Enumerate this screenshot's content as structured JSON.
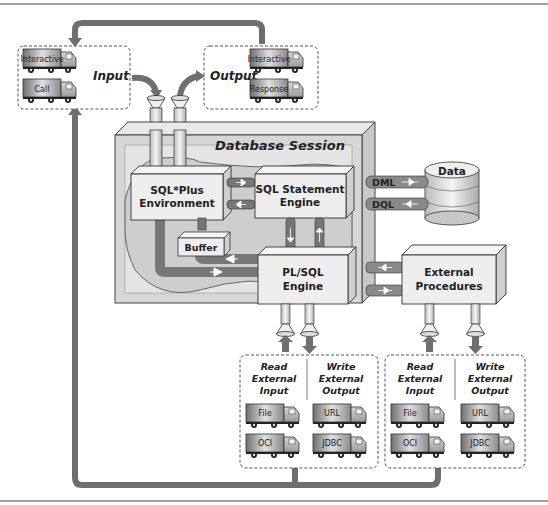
{
  "title": "Database Session",
  "colors": {
    "pipe": "#7a7a7a",
    "pipe_dark": "#555555",
    "box_fill": "#eeeeee",
    "session_fill": "#d6d6d6",
    "session_inner": "#e6e6e6",
    "line": "#333333",
    "truck_body": "#9a9a9a"
  },
  "input_box": {
    "label": "Input",
    "trucks": [
      "Interactive",
      "Call"
    ]
  },
  "output_box": {
    "label": "Output",
    "trucks": [
      "Interactive",
      "Response"
    ]
  },
  "engines": {
    "sqlplus": [
      "SQL*Plus",
      "Environment"
    ],
    "sql_statement": [
      "SQL Statement",
      "Engine"
    ],
    "buffer": "Buffer",
    "plsql": [
      "PL/SQL",
      "Engine"
    ],
    "external_procedures": [
      "External",
      "Procedures"
    ]
  },
  "data_store": {
    "label": "Data",
    "channels": [
      "DML",
      "DQL"
    ]
  },
  "external_io": [
    {
      "read": {
        "label": [
          "Read",
          "External",
          "Input"
        ],
        "trucks": [
          "File",
          "OCI"
        ]
      },
      "write": {
        "label": [
          "Write",
          "External",
          "Output"
        ],
        "trucks": [
          "URL",
          "JDBC"
        ]
      }
    },
    {
      "read": {
        "label": [
          "Read",
          "External",
          "Input"
        ],
        "trucks": [
          "File",
          "OCI"
        ]
      },
      "write": {
        "label": [
          "Write",
          "External",
          "Output"
        ],
        "trucks": [
          "URL",
          "JDBC"
        ]
      }
    }
  ]
}
